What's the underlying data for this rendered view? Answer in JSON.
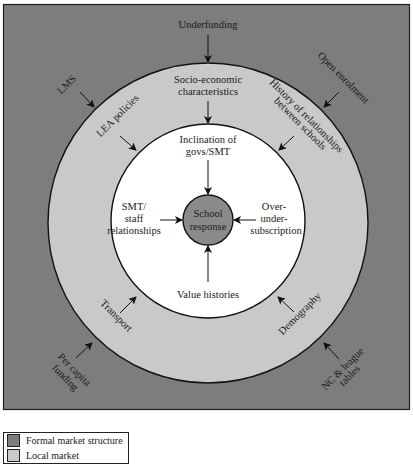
{
  "colors": {
    "outer": "#7d7d7d",
    "middle": "#c9c9c9",
    "inner": "#ffffff",
    "center": "#8a8a8a",
    "stroke": "#111111"
  },
  "center": {
    "line1": "School",
    "line2": "response"
  },
  "inner_factors": {
    "top": [
      "Inclination of",
      "govs/SMT"
    ],
    "left": [
      "SMT/",
      "staff",
      "relationships"
    ],
    "right": [
      "Over-",
      "under-",
      "subscription"
    ],
    "bottom": [
      "Value histories"
    ]
  },
  "middle_factors": {
    "top": [
      "Socio-economic",
      "characteristics"
    ],
    "top_left": "LEA policies",
    "top_right": [
      "History of relationships",
      "between schools"
    ],
    "bottom_left": "Transport",
    "bottom_right": "Demography"
  },
  "outer_factors": {
    "top": "Underfunding",
    "top_left": "LMS",
    "top_right": "Open enrolment",
    "bottom_left": [
      "Per capita",
      "funding"
    ],
    "bottom_right": [
      "NC & league",
      "tables"
    ]
  },
  "legend": {
    "items": [
      {
        "label": "Formal market structure",
        "color": "#7d7d7d"
      },
      {
        "label": "Local market",
        "color": "#c9c9c9"
      }
    ]
  }
}
